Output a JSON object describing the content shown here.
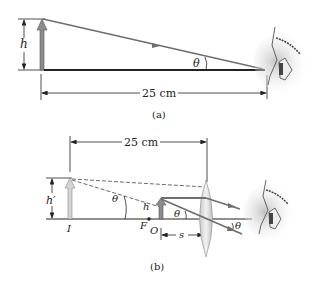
{
  "panel_a": {
    "height_label": "h",
    "angle_label": "θ",
    "distance_label": "25 cm",
    "caption": "(a)"
  },
  "panel_b": {
    "distance_label": "25 cm",
    "image_height_label": "h′",
    "object_height_label": "h",
    "angle_label_image": "θ",
    "angle_label_object": "θ",
    "angle_label_exit": "θ",
    "image_point_label": "I",
    "focal_point_label": "F",
    "object_point_label": "O",
    "object_distance_label": "s",
    "caption": "(b)"
  },
  "colors": {
    "ray": "#6e6e6e",
    "arrow_fill_dark": "#8c8c8c",
    "arrow_fill_light": "#d4d4d4",
    "lens": "#dcdcdc",
    "line": "#222222"
  }
}
